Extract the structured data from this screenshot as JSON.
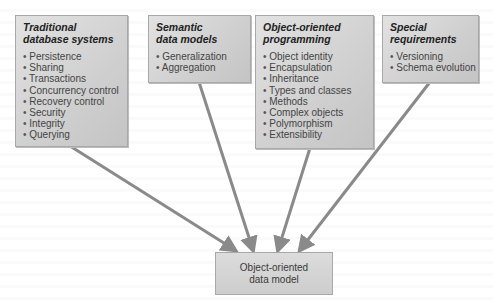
{
  "diagram": {
    "sources": [
      {
        "title": "Traditional\ndatabase systems",
        "items": [
          "Persistence",
          "Sharing",
          "Transactions",
          "Concurrency control",
          "Recovery control",
          "Security",
          "Integrity",
          "Querying"
        ]
      },
      {
        "title": "Semantic\ndata models",
        "items": [
          "Generalization",
          "Aggregation"
        ]
      },
      {
        "title": "Object-oriented\nprogramming",
        "items": [
          "Object identity",
          "Encapsulation",
          "Inheritance",
          "Types and classes",
          "Methods",
          "Complex objects",
          "Polymorphism",
          "Extensibility"
        ]
      },
      {
        "title": "Special\nrequirements",
        "items": [
          "Versioning",
          "Schema evolution"
        ]
      }
    ],
    "target": {
      "label": "Object-oriented\ndata model"
    },
    "colors": {
      "box_fill": "#d3d3d3",
      "box_border": "#a8a8a8",
      "arrow": "#8a8a8a"
    }
  }
}
